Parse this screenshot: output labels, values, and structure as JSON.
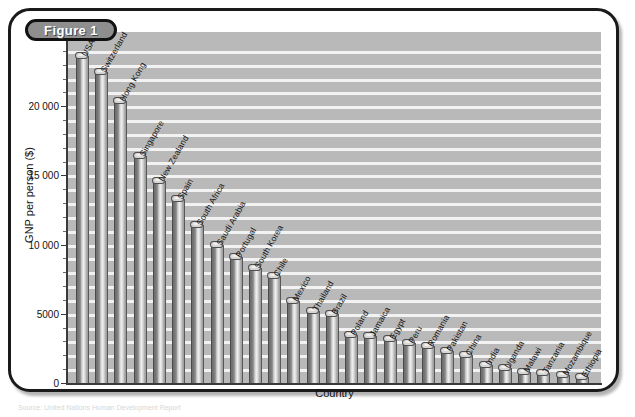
{
  "figure": {
    "badge_label": "Figure 1",
    "caption": "Source: United Nations Human Development Report"
  },
  "chart_data": {
    "type": "bar",
    "title": "",
    "xlabel": "Country",
    "ylabel": "GNP per person ($)",
    "ylim": [
      0,
      25000
    ],
    "ytick_values": [
      0,
      5000,
      10000,
      15000,
      20000
    ],
    "ytick_labels": [
      "0",
      "5000",
      "10 000",
      "15 000",
      "20 000"
    ],
    "grid": true,
    "legend": "none",
    "categories": [
      "USA",
      "Switzerland",
      "Hong Kong",
      "Singapore",
      "New Zealand",
      "Spain",
      "South Africa",
      "Saudi Arabia",
      "Portugal",
      "South Korea",
      "Chile",
      "Mexico",
      "Thailand",
      "Brazil",
      "Poland",
      "Jamaica",
      "Egypt",
      "Peru",
      "Romania",
      "Pakistan",
      "China",
      "India",
      "Uganda",
      "Malawi",
      "Tanzania",
      "Mozambique",
      "Ethiopia"
    ],
    "values": [
      23600,
      22500,
      20400,
      16400,
      14600,
      13300,
      11400,
      10000,
      9100,
      8300,
      7700,
      5900,
      5200,
      5000,
      3500,
      3400,
      3200,
      2900,
      2700,
      2300,
      2000,
      1300,
      1100,
      800,
      750,
      600,
      450
    ]
  },
  "colors": {
    "plot_background": "#b9b9b9",
    "gridline": "#f2f2f2",
    "bar_dark": "#6d6d6d",
    "bar_light": "#efefef",
    "axis": "#3a3a3a",
    "badge_fill": "#8e8e8e",
    "frame_border": "#1a1a1a"
  }
}
